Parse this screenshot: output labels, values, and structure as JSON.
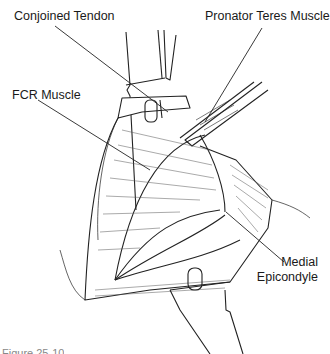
{
  "figure": {
    "labels": {
      "conjoined_tendon": "Conjoined Tendon",
      "pronator_teres": "Pronator Teres Muscle",
      "fcr_muscle": "FCR Muscle",
      "medial_epicondyle_line1": "Medial",
      "medial_epicondyle_line2": "Epicondyle"
    },
    "caption": "Figure 25-10"
  }
}
